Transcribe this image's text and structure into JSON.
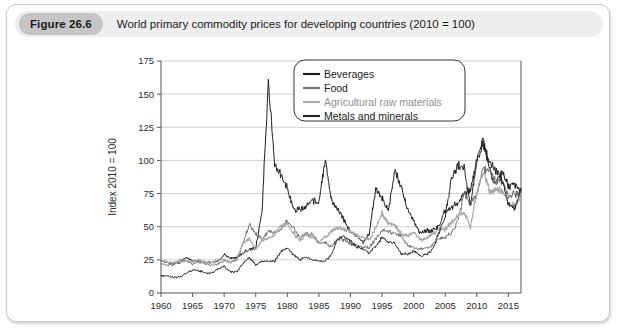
{
  "figure": {
    "badge": "Figure 26.6",
    "caption": "World primary commodity prices for developing countries (2010 = 100)"
  },
  "chart_data": {
    "type": "line",
    "title": "World primary commodity prices for developing countries (2010 = 100)",
    "xlabel": "",
    "ylabel": "Index 2010 = 100",
    "xlim": [
      1960,
      2017
    ],
    "ylim": [
      0,
      175
    ],
    "ytick_labels": [
      "0",
      "25",
      "50",
      "75",
      "100",
      "125",
      "150",
      "175"
    ],
    "yticks": [
      0,
      25,
      50,
      75,
      100,
      125,
      150,
      175
    ],
    "xtick_labels": [
      "1960",
      "1965",
      "1970",
      "1975",
      "1980",
      "1985",
      "1990",
      "1995",
      "2000",
      "2005",
      "2010",
      "2015"
    ],
    "xticks": [
      1960,
      1965,
      1970,
      1975,
      1980,
      1985,
      1990,
      1995,
      2000,
      2005,
      2010,
      2015
    ],
    "grid": true,
    "legend_position": "top-center-right",
    "colors": {
      "beverages": "#1d1d1d",
      "food": "#6f6f6f",
      "agricultural_raw_materials": "#a8a8a8",
      "metals_and_minerals": "#262626"
    },
    "series": [
      {
        "name": "Beverages",
        "color": "#1d1d1d",
        "x": [
          1960,
          1961,
          1962,
          1963,
          1964,
          1965,
          1966,
          1967,
          1968,
          1969,
          1970,
          1971,
          1972,
          1973,
          1974,
          1975,
          1976,
          1977,
          1978,
          1979,
          1980,
          1981,
          1982,
          1983,
          1984,
          1985,
          1986,
          1987,
          1988,
          1989,
          1990,
          1991,
          1992,
          1993,
          1994,
          1995,
          1996,
          1997,
          1998,
          1999,
          2000,
          2001,
          2002,
          2003,
          2004,
          2005,
          2006,
          2007,
          2008,
          2009,
          2010,
          2011,
          2012,
          2013,
          2014,
          2015,
          2016,
          2017
        ],
        "values": [
          24,
          23,
          22,
          23,
          27,
          24,
          24,
          23,
          23,
          24,
          29,
          26,
          27,
          30,
          33,
          34,
          62,
          160,
          96,
          89,
          80,
          62,
          63,
          65,
          70,
          69,
          100,
          70,
          63,
          55,
          46,
          43,
          38,
          45,
          79,
          72,
          62,
          92,
          80,
          64,
          54,
          45,
          47,
          47,
          50,
          62,
          65,
          68,
          76,
          77,
          100,
          115,
          94,
          81,
          93,
          80,
          82,
          77
        ]
      },
      {
        "name": "Food",
        "color": "#6f6f6f",
        "x": [
          1960,
          1961,
          1962,
          1963,
          1964,
          1965,
          1966,
          1967,
          1968,
          1969,
          1970,
          1971,
          1972,
          1973,
          1974,
          1975,
          1976,
          1977,
          1978,
          1979,
          1980,
          1981,
          1982,
          1983,
          1984,
          1985,
          1986,
          1987,
          1988,
          1989,
          1990,
          1991,
          1992,
          1993,
          1994,
          1995,
          1996,
          1997,
          1998,
          1999,
          2000,
          2001,
          2002,
          2003,
          2004,
          2005,
          2006,
          2007,
          2008,
          2009,
          2010,
          2011,
          2012,
          2013,
          2014,
          2015,
          2016,
          2017
        ],
        "values": [
          22,
          21,
          21,
          25,
          24,
          22,
          23,
          22,
          21,
          22,
          24,
          23,
          25,
          38,
          52,
          44,
          41,
          47,
          46,
          48,
          55,
          49,
          42,
          45,
          44,
          38,
          38,
          35,
          41,
          40,
          37,
          36,
          35,
          34,
          41,
          47,
          46,
          45,
          43,
          36,
          34,
          33,
          34,
          36,
          41,
          42,
          45,
          55,
          75,
          67,
          75,
          94,
          90,
          85,
          85,
          72,
          75,
          73
        ]
      },
      {
        "name": "Agricultural raw materials",
        "color": "#a8a8a8",
        "x": [
          1960,
          1961,
          1962,
          1963,
          1964,
          1965,
          1966,
          1967,
          1968,
          1969,
          1970,
          1971,
          1972,
          1973,
          1974,
          1975,
          1976,
          1977,
          1978,
          1979,
          1980,
          1981,
          1982,
          1983,
          1984,
          1985,
          1986,
          1987,
          1988,
          1989,
          1990,
          1991,
          1992,
          1993,
          1994,
          1995,
          1996,
          1997,
          1998,
          1999,
          2000,
          2001,
          2002,
          2003,
          2004,
          2005,
          2006,
          2007,
          2008,
          2009,
          2010,
          2011,
          2012,
          2013,
          2014,
          2015,
          2016,
          2017
        ],
        "values": [
          25,
          23,
          23,
          23,
          24,
          24,
          25,
          23,
          23,
          25,
          25,
          23,
          25,
          38,
          41,
          32,
          40,
          41,
          44,
          51,
          52,
          45,
          40,
          44,
          42,
          38,
          42,
          47,
          49,
          48,
          47,
          43,
          42,
          40,
          49,
          60,
          53,
          52,
          45,
          43,
          46,
          40,
          41,
          45,
          48,
          48,
          53,
          58,
          61,
          50,
          75,
          92,
          77,
          78,
          77,
          67,
          66,
          71
        ]
      },
      {
        "name": "Metals and minerals",
        "color": "#262626",
        "x": [
          1960,
          1961,
          1962,
          1963,
          1964,
          1965,
          1966,
          1967,
          1968,
          1969,
          1970,
          1971,
          1972,
          1973,
          1974,
          1975,
          1976,
          1977,
          1978,
          1979,
          1980,
          1981,
          1982,
          1983,
          1984,
          1985,
          1986,
          1987,
          1988,
          1989,
          1990,
          1991,
          1992,
          1993,
          1994,
          1995,
          1996,
          1997,
          1998,
          1999,
          2000,
          2001,
          2002,
          2003,
          2004,
          2005,
          2006,
          2007,
          2008,
          2009,
          2010,
          2011,
          2012,
          2013,
          2014,
          2015,
          2016,
          2017
        ],
        "values": [
          13,
          13,
          12,
          12,
          15,
          17,
          17,
          15,
          15,
          18,
          20,
          16,
          16,
          22,
          27,
          21,
          24,
          24,
          24,
          31,
          34,
          29,
          25,
          27,
          25,
          24,
          24,
          29,
          41,
          43,
          39,
          35,
          33,
          30,
          35,
          42,
          38,
          38,
          30,
          29,
          32,
          28,
          29,
          33,
          45,
          58,
          86,
          97,
          94,
          66,
          100,
          113,
          98,
          93,
          85,
          67,
          63,
          79
        ]
      }
    ],
    "annotations": [
      {
        "label": "1977 beverage price spike",
        "x": 1977,
        "y": 160
      },
      {
        "label": "2011 commodity boom peak",
        "x": 2011,
        "y": 115
      }
    ]
  },
  "legend": {
    "items": [
      {
        "label": "Beverages",
        "color": "#1d1d1d"
      },
      {
        "label": "Food",
        "color": "#6f6f6f"
      },
      {
        "label": "Agricultural raw materials",
        "color": "#a8a8a8"
      },
      {
        "label": "Metals and minerals",
        "color": "#262626"
      }
    ]
  }
}
